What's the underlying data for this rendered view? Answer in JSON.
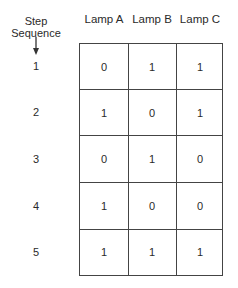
{
  "header": {
    "step_label_line1": "Step",
    "step_label_line2": "Sequence",
    "columns": [
      "Lamp A",
      "Lamp B",
      "Lamp C"
    ]
  },
  "rows": [
    {
      "step": "1",
      "values": [
        "0",
        "1",
        "1"
      ]
    },
    {
      "step": "2",
      "values": [
        "1",
        "0",
        "1"
      ]
    },
    {
      "step": "3",
      "values": [
        "0",
        "1",
        "0"
      ]
    },
    {
      "step": "4",
      "values": [
        "1",
        "0",
        "0"
      ]
    },
    {
      "step": "5",
      "values": [
        "1",
        "1",
        "1"
      ]
    }
  ],
  "icons": {
    "arrow": "down-arrow-icon"
  }
}
